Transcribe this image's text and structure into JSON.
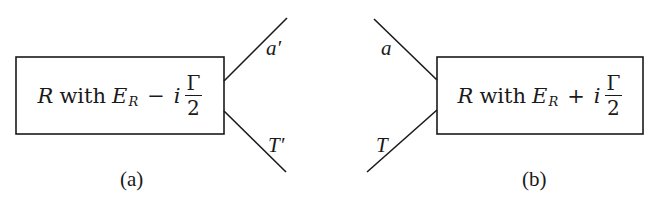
{
  "diagram_a": {
    "box": {
      "symbol": "R",
      "word": "with",
      "energy": "E",
      "energy_subscript": "R",
      "operator": "−",
      "imag": "i",
      "fraction_numerator": "Γ",
      "fraction_denominator": "2"
    },
    "lines": [
      {
        "label": "a′",
        "direction": "outgoing-upper"
      },
      {
        "label": "T′",
        "direction": "outgoing-lower"
      }
    ],
    "caption": "(a)"
  },
  "diagram_b": {
    "box": {
      "symbol": "R",
      "word": "with",
      "energy": "E",
      "energy_subscript": "R",
      "operator": "+",
      "imag": "i",
      "fraction_numerator": "Γ",
      "fraction_denominator": "2"
    },
    "lines": [
      {
        "label": "a",
        "direction": "incoming-upper"
      },
      {
        "label": "T",
        "direction": "incoming-lower"
      }
    ],
    "caption": "(b)"
  },
  "colors": {
    "ink": "#1a1a1a",
    "background": "#ffffff"
  }
}
